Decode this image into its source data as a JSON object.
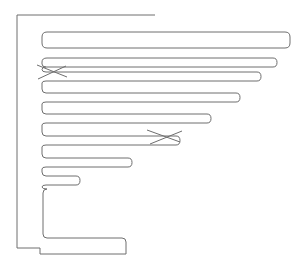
{
  "diagram": {
    "type": "comb-outline",
    "stroke_color": "#6e6e6e",
    "background": "#ffffff",
    "finger_count": 8,
    "fingers": [
      {
        "top": 32,
        "bottom": 48,
        "right": 290
      },
      {
        "top": 58,
        "bottom": 67,
        "right": 277
      },
      {
        "top": 72,
        "bottom": 81,
        "right": 261
      },
      {
        "top": 93,
        "bottom": 102,
        "right": 240
      },
      {
        "top": 114,
        "bottom": 123,
        "right": 211
      },
      {
        "top": 136,
        "bottom": 145,
        "right": 180
      },
      {
        "top": 158,
        "bottom": 167,
        "right": 132
      },
      {
        "top": 176,
        "bottom": 185,
        "right": 80
      }
    ],
    "markers": [
      {
        "label": "x-mark-1",
        "cx": 53,
        "cy": 72
      },
      {
        "label": "x-mark-2",
        "cx": 163,
        "cy": 137
      }
    ]
  }
}
